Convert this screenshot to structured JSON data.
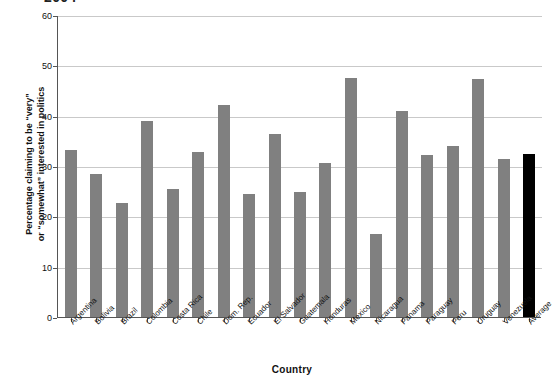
{
  "chart_data": {
    "type": "bar",
    "title": "2004",
    "xlabel": "Country",
    "ylabel": "Percentage claiming to be “very” or “somewhat” interested in politics",
    "ylabel_line1": "Percentage claiming to be “very”",
    "ylabel_line2": "or “somewhat” interested in politics",
    "ylim": [
      0,
      60
    ],
    "yticks": [
      0,
      10,
      20,
      30,
      40,
      50,
      60
    ],
    "ytick_labels": [
      "0",
      "10",
      "20",
      "30",
      "40",
      "50",
      "60"
    ],
    "grid": true,
    "legend": "none",
    "bar_color": "#808080",
    "highlight_color": "#000000",
    "highlight_category": "Average",
    "categories": [
      "Argentina",
      "Bolivia",
      "Brazil",
      "Colombia",
      "Costa Rica",
      "Chile",
      "Dom. Rep.",
      "Ecuador",
      "El Salvador",
      "Guatemala",
      "Honduras",
      "Mexico",
      "Nicaragua",
      "Panama",
      "Paraguay",
      "Peru",
      "Uruguay",
      "Venezuela",
      "Average"
    ],
    "values": [
      33.1,
      28.5,
      22.7,
      39.0,
      25.5,
      32.7,
      42.2,
      24.4,
      36.4,
      24.9,
      30.5,
      47.5,
      16.4,
      41.0,
      32.1,
      33.9,
      47.2,
      31.4,
      32.4
    ]
  }
}
